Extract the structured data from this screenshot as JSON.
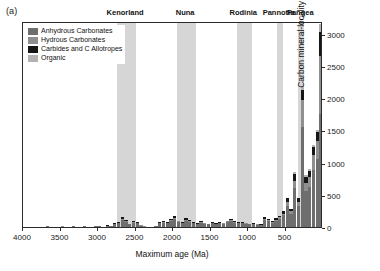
{
  "panel": {
    "label": "(a)"
  },
  "legend": {
    "items": [
      {
        "label": "Anhydrous Carbonates",
        "color": "#6e6e6e",
        "key": "anhydrous"
      },
      {
        "label": "Hydrous Carbonates",
        "color": "#8f8f8f",
        "key": "hydrous"
      },
      {
        "label": "Carbides and C Allotropes",
        "color": "#161616",
        "key": "carbide"
      },
      {
        "label": "Organic",
        "color": "#b3b3b3",
        "key": "organic"
      }
    ]
  },
  "chart_data": {
    "type": "bar",
    "title": "",
    "xlabel": "Maximum age (Ma)",
    "ylabel": "Carbon mineral-locality occurrences",
    "xlim": [
      4000,
      0
    ],
    "ylim": [
      0,
      3200
    ],
    "x_reversed": true,
    "xticks": [
      4000,
      3500,
      3000,
      2500,
      2000,
      1500,
      1000,
      500
    ],
    "yticks": [
      0,
      500,
      1000,
      1500,
      2000,
      2500,
      3000
    ],
    "grid": false,
    "legend_position": "top-left",
    "bin_width": 50,
    "stacked": true,
    "series": [
      {
        "name": "Anhydrous Carbonates",
        "key": "anhydrous",
        "color": "#6e6e6e"
      },
      {
        "name": "Hydrous Carbonates",
        "key": "hydrous",
        "color": "#8f8f8f"
      },
      {
        "name": "Carbides and C Allotropes",
        "key": "carbide",
        "color": "#161616"
      },
      {
        "name": "Organic",
        "key": "organic",
        "color": "#b3b3b3"
      }
    ],
    "bins": [
      {
        "age": 4000,
        "anhydrous": 0,
        "hydrous": 0,
        "carbide": 0,
        "organic": 0
      },
      {
        "age": 3950,
        "anhydrous": 0,
        "hydrous": 0,
        "carbide": 0,
        "organic": 0
      },
      {
        "age": 3900,
        "anhydrous": 0,
        "hydrous": 0,
        "carbide": 0,
        "organic": 0
      },
      {
        "age": 3850,
        "anhydrous": 4,
        "hydrous": 0,
        "carbide": 0,
        "organic": 0
      },
      {
        "age": 3800,
        "anhydrous": 6,
        "hydrous": 0,
        "carbide": 2,
        "organic": 0
      },
      {
        "age": 3750,
        "anhydrous": 3,
        "hydrous": 0,
        "carbide": 0,
        "organic": 0
      },
      {
        "age": 3700,
        "anhydrous": 14,
        "hydrous": 2,
        "carbide": 2,
        "organic": 0
      },
      {
        "age": 3650,
        "anhydrous": 6,
        "hydrous": 0,
        "carbide": 0,
        "organic": 0
      },
      {
        "age": 3600,
        "anhydrous": 4,
        "hydrous": 0,
        "carbide": 0,
        "organic": 0
      },
      {
        "age": 3550,
        "anhydrous": 3,
        "hydrous": 0,
        "carbide": 0,
        "organic": 0
      },
      {
        "age": 3500,
        "anhydrous": 8,
        "hydrous": 2,
        "carbide": 2,
        "organic": 0
      },
      {
        "age": 3450,
        "anhydrous": 5,
        "hydrous": 0,
        "carbide": 0,
        "organic": 0
      },
      {
        "age": 3400,
        "anhydrous": 4,
        "hydrous": 0,
        "carbide": 0,
        "organic": 0
      },
      {
        "age": 3350,
        "anhydrous": 10,
        "hydrous": 2,
        "carbide": 3,
        "organic": 0
      },
      {
        "age": 3300,
        "anhydrous": 6,
        "hydrous": 0,
        "carbide": 0,
        "organic": 0
      },
      {
        "age": 3250,
        "anhydrous": 5,
        "hydrous": 0,
        "carbide": 0,
        "organic": 0
      },
      {
        "age": 3200,
        "anhydrous": 12,
        "hydrous": 2,
        "carbide": 2,
        "organic": 0
      },
      {
        "age": 3150,
        "anhydrous": 6,
        "hydrous": 0,
        "carbide": 0,
        "organic": 0
      },
      {
        "age": 3100,
        "anhydrous": 8,
        "hydrous": 0,
        "carbide": 0,
        "organic": 0
      },
      {
        "age": 3050,
        "anhydrous": 10,
        "hydrous": 2,
        "carbide": 2,
        "organic": 0
      },
      {
        "age": 3000,
        "anhydrous": 14,
        "hydrous": 3,
        "carbide": 3,
        "organic": 0
      },
      {
        "age": 2950,
        "anhydrous": 8,
        "hydrous": 0,
        "carbide": 0,
        "organic": 0
      },
      {
        "age": 2900,
        "anhydrous": 18,
        "hydrous": 3,
        "carbide": 4,
        "organic": 0
      },
      {
        "age": 2850,
        "anhydrous": 10,
        "hydrous": 2,
        "carbide": 0,
        "organic": 0
      },
      {
        "age": 2800,
        "anhydrous": 45,
        "hydrous": 8,
        "carbide": 12,
        "organic": 0
      },
      {
        "age": 2750,
        "anhydrous": 60,
        "hydrous": 10,
        "carbide": 14,
        "organic": 0
      },
      {
        "age": 2700,
        "anhydrous": 110,
        "hydrous": 18,
        "carbide": 22,
        "organic": 0
      },
      {
        "age": 2650,
        "anhydrous": 85,
        "hydrous": 14,
        "carbide": 16,
        "organic": 0
      },
      {
        "age": 2600,
        "anhydrous": 40,
        "hydrous": 6,
        "carbide": 8,
        "organic": 0
      },
      {
        "age": 2550,
        "anhydrous": 70,
        "hydrous": 12,
        "carbide": 14,
        "organic": 0
      },
      {
        "age": 2500,
        "anhydrous": 60,
        "hydrous": 10,
        "carbide": 12,
        "organic": 0
      },
      {
        "age": 2450,
        "anhydrous": 20,
        "hydrous": 4,
        "carbide": 4,
        "organic": 0
      },
      {
        "age": 2400,
        "anhydrous": 8,
        "hydrous": 2,
        "carbide": 2,
        "organic": 0
      },
      {
        "age": 2350,
        "anhydrous": 5,
        "hydrous": 0,
        "carbide": 0,
        "organic": 0
      },
      {
        "age": 2300,
        "anhydrous": 6,
        "hydrous": 0,
        "carbide": 0,
        "organic": 0
      },
      {
        "age": 2250,
        "anhydrous": 10,
        "hydrous": 2,
        "carbide": 2,
        "organic": 0
      },
      {
        "age": 2200,
        "anhydrous": 60,
        "hydrous": 10,
        "carbide": 12,
        "organic": 0
      },
      {
        "age": 2150,
        "anhydrous": 70,
        "hydrous": 12,
        "carbide": 14,
        "organic": 0
      },
      {
        "age": 2100,
        "anhydrous": 55,
        "hydrous": 9,
        "carbide": 10,
        "organic": 0
      },
      {
        "age": 2050,
        "anhydrous": 90,
        "hydrous": 15,
        "carbide": 18,
        "organic": 0
      },
      {
        "age": 2000,
        "anhydrous": 120,
        "hydrous": 20,
        "carbide": 24,
        "organic": 0
      },
      {
        "age": 1950,
        "anhydrous": 75,
        "hydrous": 12,
        "carbide": 14,
        "organic": 0
      },
      {
        "age": 1900,
        "anhydrous": 60,
        "hydrous": 10,
        "carbide": 12,
        "organic": 0
      },
      {
        "age": 1850,
        "anhydrous": 100,
        "hydrous": 16,
        "carbide": 20,
        "organic": 0
      },
      {
        "age": 1800,
        "anhydrous": 80,
        "hydrous": 13,
        "carbide": 15,
        "organic": 0
      },
      {
        "age": 1750,
        "anhydrous": 55,
        "hydrous": 9,
        "carbide": 10,
        "organic": 0
      },
      {
        "age": 1700,
        "anhydrous": 45,
        "hydrous": 7,
        "carbide": 8,
        "organic": 0
      },
      {
        "age": 1650,
        "anhydrous": 70,
        "hydrous": 11,
        "carbide": 13,
        "organic": 0
      },
      {
        "age": 1600,
        "anhydrous": 50,
        "hydrous": 8,
        "carbide": 9,
        "organic": 0
      },
      {
        "age": 1550,
        "anhydrous": 40,
        "hydrous": 6,
        "carbide": 7,
        "organic": 0
      },
      {
        "age": 1500,
        "anhydrous": 55,
        "hydrous": 9,
        "carbide": 10,
        "organic": 0
      },
      {
        "age": 1450,
        "anhydrous": 45,
        "hydrous": 7,
        "carbide": 8,
        "organic": 0
      },
      {
        "age": 1400,
        "anhydrous": 60,
        "hydrous": 10,
        "carbide": 11,
        "organic": 0
      },
      {
        "age": 1350,
        "anhydrous": 50,
        "hydrous": 8,
        "carbide": 9,
        "organic": 0
      },
      {
        "age": 1300,
        "anhydrous": 75,
        "hydrous": 12,
        "carbide": 14,
        "organic": 0
      },
      {
        "age": 1250,
        "anhydrous": 95,
        "hydrous": 15,
        "carbide": 18,
        "organic": 0
      },
      {
        "age": 1200,
        "anhydrous": 70,
        "hydrous": 11,
        "carbide": 13,
        "organic": 0
      },
      {
        "age": 1150,
        "anhydrous": 55,
        "hydrous": 9,
        "carbide": 10,
        "organic": 0
      },
      {
        "age": 1100,
        "anhydrous": 60,
        "hydrous": 10,
        "carbide": 11,
        "organic": 0
      },
      {
        "age": 1050,
        "anhydrous": 50,
        "hydrous": 8,
        "carbide": 9,
        "organic": 0
      },
      {
        "age": 1000,
        "anhydrous": 40,
        "hydrous": 6,
        "carbide": 7,
        "organic": 0
      },
      {
        "age": 950,
        "anhydrous": 45,
        "hydrous": 7,
        "carbide": 8,
        "organic": 0
      },
      {
        "age": 900,
        "anhydrous": 35,
        "hydrous": 6,
        "carbide": 6,
        "organic": 0
      },
      {
        "age": 850,
        "anhydrous": 30,
        "hydrous": 5,
        "carbide": 5,
        "organic": 0
      },
      {
        "age": 800,
        "anhydrous": 110,
        "hydrous": 18,
        "carbide": 22,
        "organic": 0
      },
      {
        "age": 750,
        "anhydrous": 90,
        "hydrous": 15,
        "carbide": 18,
        "organic": 0
      },
      {
        "age": 700,
        "anhydrous": 70,
        "hydrous": 11,
        "carbide": 13,
        "organic": 0
      },
      {
        "age": 650,
        "anhydrous": 100,
        "hydrous": 16,
        "carbide": 20,
        "organic": 0
      },
      {
        "age": 600,
        "anhydrous": 130,
        "hydrous": 21,
        "carbide": 25,
        "organic": 0
      },
      {
        "age": 550,
        "anhydrous": 180,
        "hydrous": 30,
        "carbide": 35,
        "organic": 0
      },
      {
        "age": 500,
        "anhydrous": 330,
        "hydrous": 55,
        "carbide": 60,
        "organic": 5
      },
      {
        "age": 450,
        "anhydrous": 210,
        "hydrous": 35,
        "carbide": 40,
        "organic": 3
      },
      {
        "age": 400,
        "anhydrous": 600,
        "hydrous": 120,
        "carbide": 110,
        "organic": 20
      },
      {
        "age": 350,
        "anhydrous": 330,
        "hydrous": 60,
        "carbide": 55,
        "organic": 10
      },
      {
        "age": 300,
        "anhydrous": 1550,
        "hydrous": 420,
        "carbide": 160,
        "organic": 60
      },
      {
        "age": 250,
        "anhydrous": 560,
        "hydrous": 130,
        "carbide": 90,
        "organic": 25
      },
      {
        "age": 200,
        "anhydrous": 620,
        "hydrous": 150,
        "carbide": 100,
        "organic": 30
      },
      {
        "age": 150,
        "anhydrous": 880,
        "hydrous": 240,
        "carbide": 120,
        "organic": 40
      },
      {
        "age": 100,
        "anhydrous": 1050,
        "hydrous": 290,
        "carbide": 130,
        "organic": 45
      },
      {
        "age": 50,
        "anhydrous": 1750,
        "hydrous": 900,
        "carbide": 380,
        "organic": 120
      }
    ],
    "supercontinents": [
      {
        "name": "Kenorland",
        "start": 2750,
        "end": 2500
      },
      {
        "name": "Nuna",
        "start": 1950,
        "end": 1700
      },
      {
        "name": "Rodinia",
        "start": 1150,
        "end": 950
      },
      {
        "name": "Pannotia",
        "start": 620,
        "end": 540
      },
      {
        "name": "Pangea",
        "start": 330,
        "end": 250
      }
    ]
  }
}
